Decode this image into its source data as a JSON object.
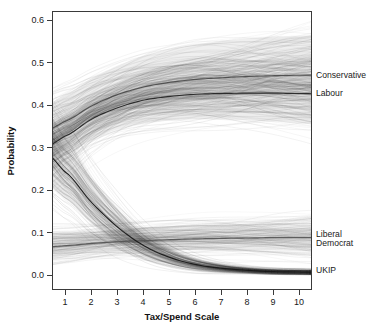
{
  "chart_data": {
    "type": "line",
    "title": "",
    "subtitle": "",
    "xlabel": "Tax/Spend Scale",
    "ylabel": "Probability",
    "xlim": [
      0.5,
      10.5
    ],
    "ylim": [
      0.0,
      0.6
    ],
    "grid": false,
    "legend_position": "right-inline-labels",
    "x": [
      1,
      2,
      3,
      4,
      5,
      6,
      7,
      8,
      9,
      10
    ],
    "xticklabels": [
      "1",
      "2",
      "3",
      "4",
      "5",
      "6",
      "7",
      "8",
      "9",
      "10"
    ],
    "yticks": [
      0.0,
      0.1,
      0.2,
      0.3,
      0.4,
      0.5,
      0.6
    ],
    "yticklabels": [
      "0.0",
      "0.1",
      "0.2",
      "0.3",
      "0.4",
      "0.5",
      "0.6"
    ],
    "series": [
      {
        "name": "Conservative",
        "label": "Conservative",
        "color": "#4a4a4a",
        "band_color": "#9a9a9a",
        "values": [
          0.362,
          0.397,
          0.424,
          0.442,
          0.453,
          0.46,
          0.464,
          0.467,
          0.469,
          0.47
        ],
        "band_low": [
          0.3,
          0.345,
          0.378,
          0.398,
          0.41,
          0.416,
          0.42,
          0.422,
          0.423,
          0.424
        ],
        "band_high": [
          0.425,
          0.462,
          0.492,
          0.515,
          0.53,
          0.542,
          0.551,
          0.557,
          0.561,
          0.563
        ],
        "label_y": 0.47
      },
      {
        "name": "Labour",
        "label": "Labour",
        "color": "#232323",
        "band_color": "#8d8d8d",
        "values": [
          0.327,
          0.366,
          0.393,
          0.411,
          0.42,
          0.425,
          0.427,
          0.428,
          0.428,
          0.427
        ],
        "band_low": [
          0.282,
          0.318,
          0.342,
          0.356,
          0.363,
          0.366,
          0.366,
          0.364,
          0.361,
          0.357
        ],
        "band_high": [
          0.372,
          0.407,
          0.432,
          0.45,
          0.461,
          0.467,
          0.47,
          0.471,
          0.471,
          0.47
        ],
        "label_y": 0.428
      },
      {
        "name": "Liberal Democrat",
        "label_line1": "Liberal",
        "label_line2": "Democrat",
        "color": "#555555",
        "band_color": "#b5b5b5",
        "values": [
          0.069,
          0.074,
          0.078,
          0.081,
          0.083,
          0.085,
          0.086,
          0.087,
          0.088,
          0.088
        ],
        "band_low": [
          0.046,
          0.052,
          0.056,
          0.058,
          0.059,
          0.059,
          0.059,
          0.059,
          0.058,
          0.057
        ],
        "band_high": [
          0.1,
          0.104,
          0.108,
          0.112,
          0.115,
          0.117,
          0.119,
          0.12,
          0.121,
          0.122
        ],
        "label_y": 0.088
      },
      {
        "name": "UKIP",
        "label": "UKIP",
        "color": "#171717",
        "band_color": "#7d7d7d",
        "values": [
          0.242,
          0.172,
          0.114,
          0.07,
          0.042,
          0.025,
          0.016,
          0.011,
          0.008,
          0.007
        ],
        "band_low": [
          0.18,
          0.122,
          0.076,
          0.045,
          0.026,
          0.014,
          0.008,
          0.005,
          0.003,
          0.002
        ],
        "band_high": [
          0.3,
          0.224,
          0.156,
          0.101,
          0.063,
          0.039,
          0.025,
          0.017,
          0.013,
          0.011
        ],
        "label_y": 0.012
      }
    ]
  },
  "labels": {
    "conservative": "Conservative",
    "labour": "Labour",
    "libdem_line1": "Liberal",
    "libdem_line2": "Democrat",
    "ukip": "UKIP",
    "xlabel": "Tax/Spend Scale",
    "ylabel": "Probability"
  }
}
